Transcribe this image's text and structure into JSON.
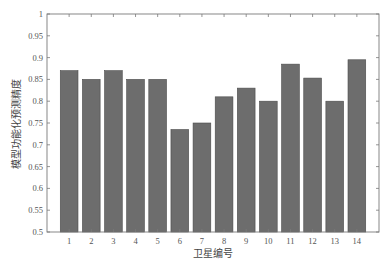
{
  "chart_data": {
    "type": "bar",
    "title": "",
    "xlabel": "卫星编号",
    "ylabel": "模型功能化预测精度",
    "categories": [
      "1",
      "2",
      "3",
      "4",
      "5",
      "6",
      "7",
      "8",
      "9",
      "10",
      "11",
      "12",
      "13",
      "14"
    ],
    "values": [
      0.87,
      0.85,
      0.87,
      0.85,
      0.85,
      0.735,
      0.75,
      0.81,
      0.83,
      0.8,
      0.885,
      0.853,
      0.8,
      0.895
    ],
    "ylim": [
      0.5,
      1.0
    ],
    "xlim": [
      0,
      15
    ],
    "yticks": [
      0.5,
      0.55,
      0.6,
      0.65,
      0.7,
      0.75,
      0.8,
      0.85,
      0.9,
      0.95,
      1
    ],
    "ytick_labels": [
      "0.5",
      "0.55",
      "0.6",
      "0.65",
      "0.7",
      "0.75",
      "0.8",
      "0.85",
      "0.9",
      "0.95",
      "1"
    ],
    "grid": false,
    "legend": null,
    "bar_color": "#6d6d6d",
    "box": true
  }
}
